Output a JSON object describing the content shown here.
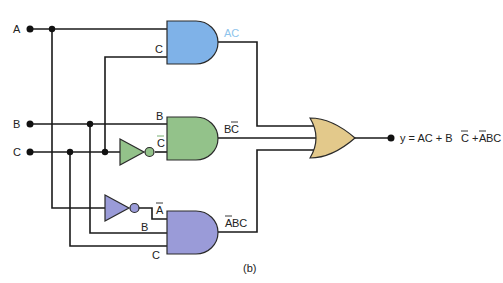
{
  "figure": {
    "caption": "(b)",
    "inputs": [
      "A",
      "B",
      "C"
    ],
    "output_expression": "y = AC + BC + ABC",
    "output_expression_parts": [
      {
        "text": "y = AC + B",
        "overbar": false
      },
      {
        "text": "C",
        "overbar": true
      },
      {
        "text": " + ",
        "overbar": false
      },
      {
        "text": "A",
        "overbar": true
      },
      {
        "text": "BC",
        "overbar": false
      }
    ]
  },
  "gates": [
    {
      "id": "and1",
      "type": "AND",
      "color": "#7fb2e8",
      "inputs": [
        "A",
        "C"
      ],
      "output_label": "AC",
      "output_label_color": "#8ec4ec"
    },
    {
      "id": "and2",
      "type": "AND",
      "color": "#93c28a",
      "inputs": [
        "B",
        "C̄"
      ],
      "output_label": "BC̄"
    },
    {
      "id": "and3",
      "type": "AND",
      "color": "#9a9bd8",
      "inputs": [
        "Ā",
        "B",
        "C"
      ],
      "output_label": "ĀBC"
    },
    {
      "id": "or1",
      "type": "OR",
      "color": "#e3c98b",
      "inputs": [
        "AC",
        "BC̄",
        "ĀBC"
      ],
      "output_label": "y"
    }
  ],
  "inverters": [
    {
      "id": "not_c",
      "color": "#93c28a",
      "input": "C",
      "output": "C̄"
    },
    {
      "id": "not_a",
      "color": "#9a9bd8",
      "input": "A",
      "output": "Ā"
    }
  ],
  "labels": {
    "in_a": "A",
    "in_b": "B",
    "in_c": "C",
    "and1_in_c": "C",
    "and1_out": "AC",
    "and2_in_b": "B",
    "and2_in_cbar": "C",
    "and2_out_b": "B",
    "and2_out_c": "C",
    "and3_in_abar": "A",
    "and3_in_b": "B",
    "and3_in_c": "C",
    "and3_out_a": "A",
    "and3_out_bc": "BC",
    "out_y_prefix": "y = AC + B",
    "out_c": "C",
    "out_plus": " + ",
    "out_a": "A",
    "out_bc": "BC",
    "caption": "(b)"
  },
  "colors": {
    "and1": "#7fb2e8",
    "and2": "#93c28a",
    "and3": "#9a9bd8",
    "or": "#e3c98b",
    "ac_label": "#8ec4ec",
    "wire": "#1a1a1a"
  }
}
